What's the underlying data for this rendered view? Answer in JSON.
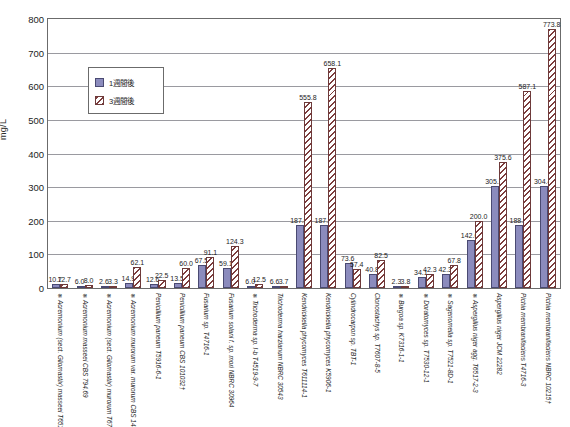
{
  "axis": {
    "y_title": "mg/L",
    "y_ticks": [
      "800",
      "700",
      "600",
      "500",
      "400",
      "300",
      "200",
      "100",
      "0"
    ]
  },
  "legend": {
    "items": [
      {
        "key": "w1",
        "label": "1週間後"
      },
      {
        "key": "w3",
        "label": "3週間後"
      }
    ]
  },
  "chart_data": {
    "type": "bar",
    "title": "",
    "xlabel": "",
    "ylabel": "mg/L",
    "ylim": [
      0,
      800
    ],
    "ytick_step": 100,
    "grid": true,
    "legend_position": "upper-left-inside",
    "categories": [
      "※ Acremonium (sect. Gliomastix) masseei T6517-1-1",
      "※ Acremonium masseei CBS 794.69",
      "※ Acremonium (sect. Gliomastix) murorum T6713-14-2",
      "※ Acremonium murorum var. murorum CBS 148.81",
      "Penicillium paneum T5916-6-1",
      "Penicillium paneum CBS 101032†",
      "Fusarium sp. T4716-1",
      "Fusarium solani f. sp. mori NBRC 30964",
      "※ Trichoderma sp. I-b T4519-9-7",
      "Trichoderma harzianum NBRC 30543",
      "Kendrickiella phycomyces T611114-1",
      "Kendrickiella phycomyces K5906-1",
      "Cylindrocarpon sp. TBT-1",
      "Clonostachys sp. T7607-8-5",
      "※ Burgoa sp. K7316-1-1",
      "※ Doratomyces sp. T7530-12-1",
      "※ Sagenomella sp. T7521-8D-1",
      "※ Aspergillus niger agg. T6517-2-3",
      "Aspergillus niger JCM 22282",
      "Pichia membranifaciens T4716-3",
      "Pichia membranifaciens NBRC 10215†"
    ],
    "series": [
      {
        "name": "1週間後",
        "key": "w1",
        "color": "#8b8bbd",
        "values": [
          10.7,
          6.0,
          2.6,
          14.9,
          12.6,
          13.5,
          67.5,
          59.1,
          6.0,
          6.6,
          187.8,
          187.4,
          73.6,
          40.8,
          2.3,
          34.1,
          42.3,
          142.6,
          305.2,
          188.5,
          304.4
        ]
      },
      {
        "name": "3週間後",
        "key": "w3",
        "color": "#7d3d3d",
        "values": [
          12.7,
          8.0,
          3.3,
          62.1,
          22.5,
          60.0,
          91.1,
          124.3,
          12.5,
          3.7,
          555.8,
          658.1,
          57.4,
          82.5,
          3.8,
          42.3,
          67.8,
          200.0,
          375.6,
          587.1,
          773.8
        ]
      }
    ]
  }
}
